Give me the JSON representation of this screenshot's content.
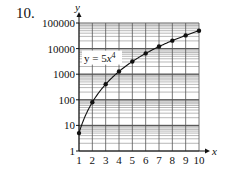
{
  "problem_number": "10.",
  "chart_data": {
    "type": "line",
    "title": "",
    "xlabel": "x",
    "ylabel": "y",
    "equation_label": "y = 5x⁴",
    "equation_parts": {
      "prefix": "y = 5",
      "var": "x",
      "exp": "4"
    },
    "x": [
      1,
      2,
      3,
      4,
      5,
      6,
      7,
      8,
      9,
      10
    ],
    "series": [
      {
        "name": "y = 5x^4",
        "values": [
          5,
          80,
          405,
          1280,
          3125,
          6480,
          12005,
          20480,
          32805,
          50000
        ]
      }
    ],
    "x_ticks": [
      "1",
      "2",
      "3",
      "4",
      "5",
      "6",
      "7",
      "8",
      "9",
      "10"
    ],
    "y_ticks": [
      "1",
      "10",
      "100",
      "1000",
      "10000",
      "100000"
    ],
    "y_scale": "log",
    "xlim": [
      1,
      10
    ],
    "ylim": [
      1,
      100000
    ],
    "grid": true,
    "legend": "none"
  }
}
